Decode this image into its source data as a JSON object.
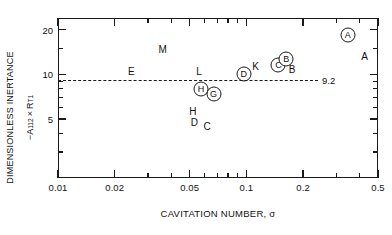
{
  "chart_data": {
    "type": "scatter",
    "title": "",
    "xlabel": "CAVITATION NUMBER, σ",
    "ylabel_line1": "DIMENSIONLESS INERTANCE",
    "ylabel_line2_prefix": "−A",
    "ylabel_line2_sub1": "112",
    "ylabel_line2_times": "×",
    "ylabel_line2_R": "R",
    "ylabel_line2_sub2": "T1",
    "xscale": "log",
    "yscale": "log",
    "xlim": [
      0.01,
      0.5
    ],
    "ylim": [
      2.0,
      24.0
    ],
    "grid": false,
    "legend": "none",
    "xticks_major": [
      {
        "value": 0.01,
        "label": "0.01"
      },
      {
        "value": 0.02,
        "label": "0.02"
      },
      {
        "value": 0.05,
        "label": "0.05"
      },
      {
        "value": 0.1,
        "label": "0.1"
      },
      {
        "value": 0.2,
        "label": "0.2"
      },
      {
        "value": 0.5,
        "label": "0.5"
      }
    ],
    "xticks_minor": [
      0.03,
      0.04,
      0.06,
      0.07,
      0.08,
      0.09,
      0.3,
      0.4
    ],
    "yticks_major": [
      {
        "value": 20,
        "label": "20"
      },
      {
        "value": 10,
        "label": "10"
      },
      {
        "value": 5,
        "label": "5"
      }
    ],
    "yticks_minor": [
      3,
      4,
      6,
      7,
      8,
      9,
      15
    ],
    "reference_line": {
      "value": 9.2,
      "label": "9.2",
      "style": "dashed"
    },
    "points": [
      {
        "label": "M",
        "x": 0.036,
        "y": 14.6,
        "circled": false
      },
      {
        "label": "E",
        "x": 0.0245,
        "y": 10.3,
        "circled": false
      },
      {
        "label": "L",
        "x": 0.056,
        "y": 10.3,
        "circled": false
      },
      {
        "label": "H",
        "x": 0.0575,
        "y": 8.0,
        "circled": true
      },
      {
        "label": "G",
        "x": 0.067,
        "y": 7.4,
        "circled": true
      },
      {
        "label": "H",
        "x": 0.052,
        "y": 5.6,
        "circled": false
      },
      {
        "label": "D",
        "x": 0.053,
        "y": 4.7,
        "circled": false
      },
      {
        "label": "C",
        "x": 0.062,
        "y": 4.4,
        "circled": false
      },
      {
        "label": "D",
        "x": 0.097,
        "y": 10.0,
        "circled": true
      },
      {
        "label": "K",
        "x": 0.112,
        "y": 11.3,
        "circled": false
      },
      {
        "label": "C",
        "x": 0.148,
        "y": 11.5,
        "circled": true
      },
      {
        "label": "B",
        "x": 0.163,
        "y": 12.6,
        "circled": true
      },
      {
        "label": "B",
        "x": 0.175,
        "y": 10.7,
        "circled": false
      },
      {
        "label": "A",
        "x": 0.345,
        "y": 18.3,
        "circled": true
      },
      {
        "label": "A",
        "x": 0.425,
        "y": 13.0,
        "circled": false
      }
    ]
  },
  "style": {
    "axis_color": "#1a1a1a",
    "text_color": "#111111",
    "background": "#ffffff"
  }
}
